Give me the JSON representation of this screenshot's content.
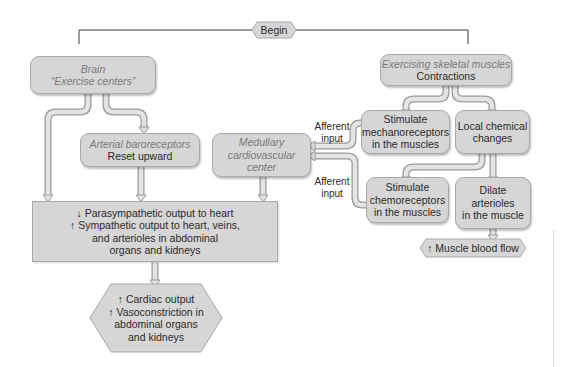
{
  "begin": {
    "label": "Begin"
  },
  "brain": {
    "title": "Brain",
    "subtitle": "“Exercise centers”"
  },
  "baroreceptors": {
    "title": "Arterial baroreceptors",
    "subtitle": "Reset upward"
  },
  "medullary": {
    "line1": "Medullary",
    "line2": "cardiovascular",
    "line3": "center"
  },
  "muscles": {
    "title": "Exercising skeletal muscles",
    "subtitle": "Contractions"
  },
  "mechanoreceptors": {
    "line1": "Stimulate",
    "line2": "mechanoreceptors",
    "line3": "in the muscles"
  },
  "chemical": {
    "line1": "Local chemical",
    "line2": "changes"
  },
  "chemoreceptors": {
    "line1": "Stimulate",
    "line2": "chemoreceptors",
    "line3": "in the muscles"
  },
  "dilate": {
    "line1": "Dilate",
    "line2": "arterioles",
    "line3": "in the muscle"
  },
  "output_box": {
    "line1": "↓ Parasympathetic output to heart",
    "line2": "↑ Sympathetic output to heart, veins,",
    "line3": "and arterioles in abdominal",
    "line4": "organs and kidneys"
  },
  "cardiac": {
    "line1": "↑ Cardiac output",
    "line2": "↑ Vasoconstriction in",
    "line3": "abdominal organs",
    "line4": "and kidneys"
  },
  "muscle_flow": {
    "label": "↑ Muscle blood flow"
  },
  "afferent_top": {
    "line1": "Afferent",
    "line2": "input"
  },
  "afferent_bottom": {
    "line1": "Afferent",
    "line2": "input"
  },
  "colors": {
    "box_fill": "#d6d6d6",
    "box_border": "#a9a9a9",
    "italic_text": "#7a7a7a",
    "line": "#3a3a3a"
  }
}
